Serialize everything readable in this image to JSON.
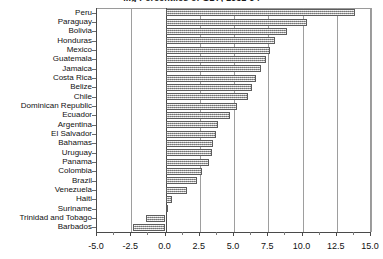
{
  "chart_data": {
    "type": "bar",
    "orientation": "horizontal",
    "title": "...g Percentiles of GDP, 1951-94",
    "xlabel": "",
    "ylabel": "",
    "xlim": [
      -5.0,
      15.0
    ],
    "xticks": [
      -5.0,
      -2.5,
      0.0,
      2.5,
      5.0,
      7.5,
      10.0,
      12.5,
      15.0
    ],
    "xtick_labels": [
      "-5.0",
      "-2.5",
      "0.0",
      "2.5",
      "5.0",
      "7.5",
      "10.0",
      "12.5",
      "15.0"
    ],
    "grid": true,
    "grid_axis": "x",
    "legend": null,
    "bar_fill": "gray-hatch",
    "categories": [
      "Peru",
      "Paraguay",
      "Bolivia",
      "Honduras",
      "Mexico",
      "Guatemala",
      "Jamaica",
      "Costa Rica",
      "Belize",
      "Chile",
      "Dominican Republic",
      "Ecuador",
      "Argentina",
      "El Salvador",
      "Bahamas",
      "Uruguay",
      "Panama",
      "Colombia",
      "Brazil",
      "Venezuela",
      "Haiti",
      "Suriname",
      "Trinidad and Tobago",
      "Barbados"
    ],
    "values": [
      13.8,
      10.3,
      8.9,
      8.0,
      7.6,
      7.3,
      7.0,
      6.6,
      6.3,
      6.0,
      5.2,
      4.7,
      3.8,
      3.7,
      3.5,
      3.4,
      3.2,
      2.7,
      2.3,
      1.6,
      0.5,
      0.1,
      -1.4,
      -2.4
    ]
  },
  "axis": {
    "x_min_label": "-5.0",
    "x_max_label": "15.0"
  }
}
